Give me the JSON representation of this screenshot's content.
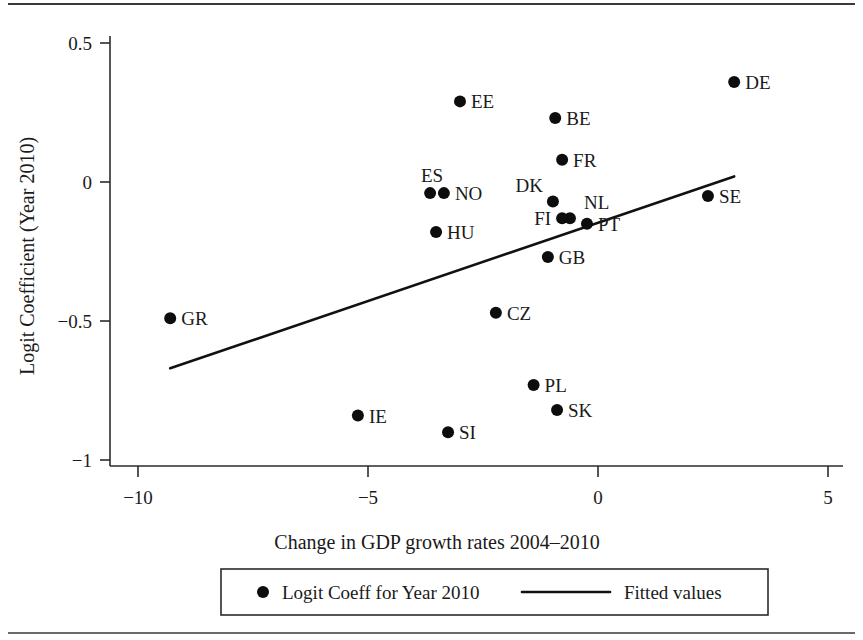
{
  "chart_data": {
    "type": "scatter",
    "title": "",
    "xlabel": "Change in GDP growth rates 2004–2010",
    "ylabel": "Logit Coefficient (Year 2010)",
    "xlim": [
      -10.9,
      5.7
    ],
    "ylim": [
      -1.09,
      0.59
    ],
    "xticks": [
      -10,
      -5,
      0,
      5
    ],
    "xticklabels": [
      "-10",
      "-5",
      "0",
      "5"
    ],
    "yticks": [
      0.5,
      0,
      -0.5,
      -1
    ],
    "yticklabels": [
      "0.5",
      "0",
      "-0.5",
      "-1"
    ],
    "grid": false,
    "legend_position": "bottom-center",
    "series": [
      {
        "name": "Logit Coeff for Year 2010",
        "marker": "filled-circle",
        "color": "#0d0d0d",
        "points": [
          {
            "label": "DE",
            "x": 2.96,
            "y": 0.36,
            "label_side": "right"
          },
          {
            "label": "EE",
            "x": -3.0,
            "y": 0.29,
            "label_side": "right"
          },
          {
            "label": "BE",
            "x": -0.93,
            "y": 0.23,
            "label_side": "right"
          },
          {
            "label": "FR",
            "x": -0.78,
            "y": 0.08,
            "label_side": "right"
          },
          {
            "label": "ES",
            "x": -3.65,
            "y": -0.04,
            "label_side": "above"
          },
          {
            "label": "NO",
            "x": -3.35,
            "y": -0.04,
            "label_side": "right"
          },
          {
            "label": "SE",
            "x": 2.39,
            "y": -0.05,
            "label_side": "right"
          },
          {
            "label": "DK",
            "x": -0.98,
            "y": -0.07,
            "label_side": "upper-left"
          },
          {
            "label": "NL",
            "x": -0.61,
            "y": -0.13,
            "label_side": "upper-right"
          },
          {
            "label": "FI",
            "x": -0.78,
            "y": -0.13,
            "label_side": "left"
          },
          {
            "label": "PT",
            "x": -0.24,
            "y": -0.15,
            "label_side": "right"
          },
          {
            "label": "HU",
            "x": -3.52,
            "y": -0.18,
            "label_side": "right"
          },
          {
            "label": "GB",
            "x": -1.09,
            "y": -0.27,
            "label_side": "right"
          },
          {
            "label": "CZ",
            "x": -2.22,
            "y": -0.47,
            "label_side": "right"
          },
          {
            "label": "GR",
            "x": -9.3,
            "y": -0.49,
            "label_side": "right"
          },
          {
            "label": "PL",
            "x": -1.4,
            "y": -0.73,
            "label_side": "right"
          },
          {
            "label": "SK",
            "x": -0.89,
            "y": -0.82,
            "label_side": "right"
          },
          {
            "label": "IE",
            "x": -5.22,
            "y": -0.84,
            "label_side": "right"
          },
          {
            "label": "SI",
            "x": -3.26,
            "y": -0.9,
            "label_side": "right"
          }
        ]
      },
      {
        "name": "Fitted values",
        "type": "line",
        "color": "#111111",
        "endpoints": [
          {
            "x": -9.3,
            "y": -0.67
          },
          {
            "x": 2.96,
            "y": 0.02
          }
        ]
      }
    ]
  },
  "legend": {
    "entries": [
      {
        "marker": "filled-circle",
        "label": "Logit Coeff for Year 2010"
      },
      {
        "marker": "line-segment",
        "label": "Fitted values"
      }
    ]
  }
}
